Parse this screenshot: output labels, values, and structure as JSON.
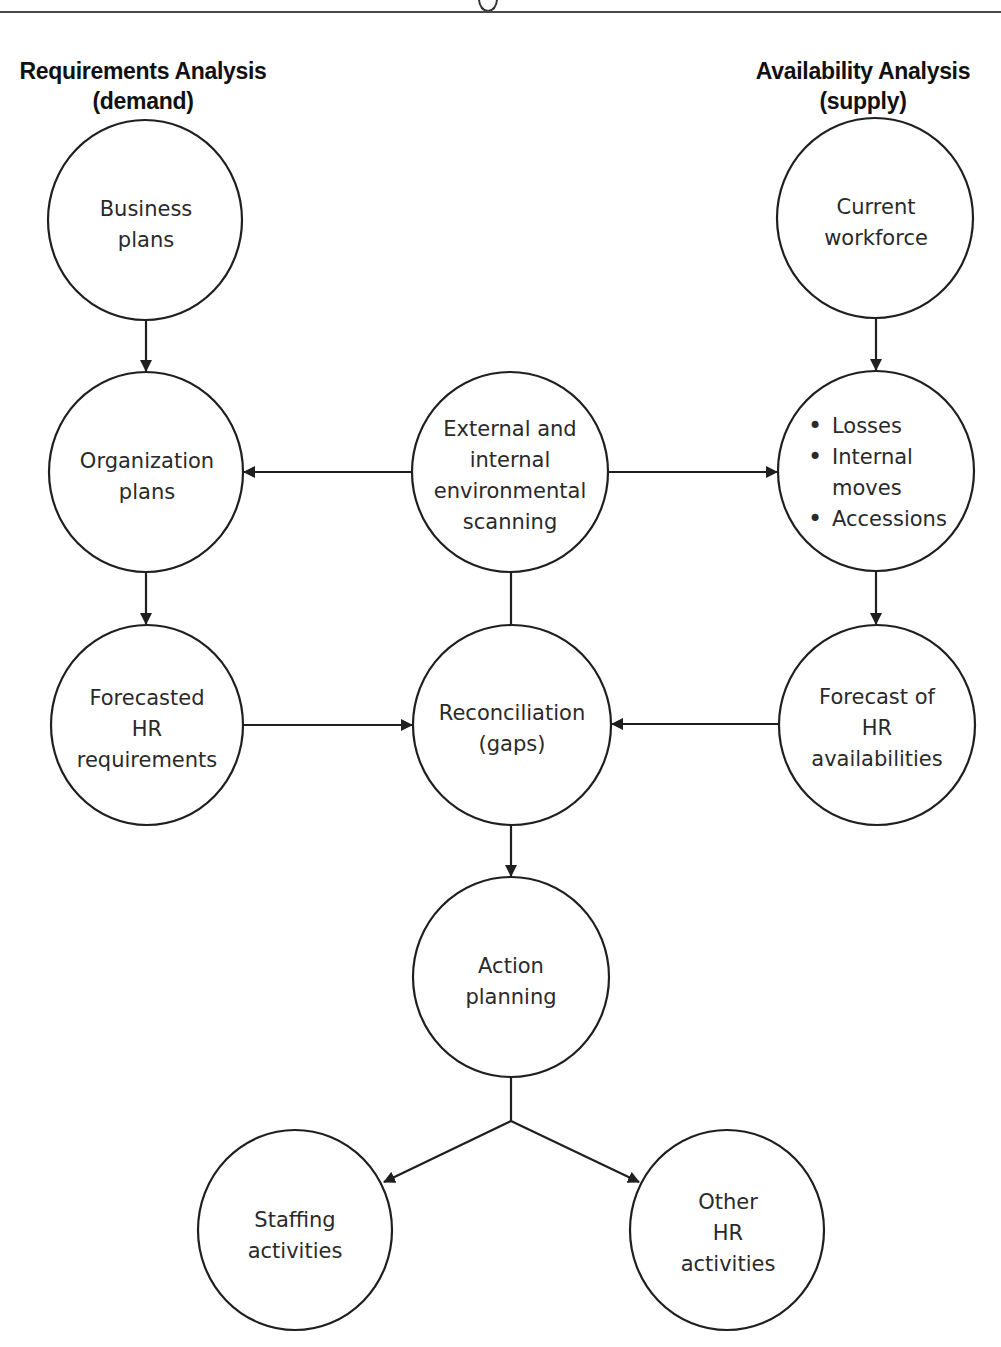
{
  "header": {
    "left_title": "Requirements Analysis",
    "left_subtitle": "(demand)",
    "right_title": "Availability Analysis",
    "right_subtitle": "(supply)"
  },
  "nodes": {
    "business_plans": {
      "lines": [
        "Business",
        "plans"
      ]
    },
    "organization_plans": {
      "lines": [
        "Organization",
        "plans"
      ]
    },
    "environmental_scanning": {
      "lines": [
        "External and",
        "internal",
        "environmental",
        "scanning"
      ]
    },
    "current_workforce": {
      "lines": [
        "Current",
        "workforce"
      ]
    },
    "workforce_changes": {
      "items": [
        {
          "text": "Losses",
          "bullet": true
        },
        {
          "text": "Internal",
          "bullet": true
        },
        {
          "text": "moves",
          "bullet": false
        },
        {
          "text": "Accessions",
          "bullet": true
        }
      ]
    },
    "forecasted_requirements": {
      "lines": [
        "Forecasted",
        "HR",
        "requirements"
      ]
    },
    "reconciliation": {
      "lines": [
        "Reconciliation",
        "(gaps)"
      ]
    },
    "forecast_availabilities": {
      "lines": [
        "Forecast of",
        "HR",
        "availabilities"
      ]
    },
    "action_planning": {
      "lines": [
        "Action",
        "planning"
      ]
    },
    "staffing_activities": {
      "lines": [
        "Staffing",
        "activities"
      ]
    },
    "other_hr_activities": {
      "lines": [
        "Other",
        "HR",
        "activities"
      ]
    }
  },
  "colors": {
    "stroke": "#1f1f1f",
    "text": "#2a2a2a",
    "background": "#ffffff"
  }
}
